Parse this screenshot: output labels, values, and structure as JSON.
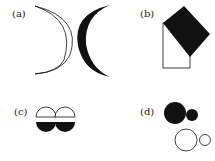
{
  "figure": {
    "panels": [
      {
        "id": "a",
        "label": "(a)",
        "content": "two thin arc outlines (crescent outline) and a filled black crescent"
      },
      {
        "id": "b",
        "label": "(b)",
        "content": "rotated black square overlapping a white rectangle outline"
      },
      {
        "id": "c",
        "label": "(c)",
        "content": "two white semicircle domes above two black semicircle bowls"
      },
      {
        "id": "d",
        "label": "(d)",
        "content": "large and small black circles above large and small white outline circles"
      }
    ],
    "colors": {
      "ink": "#111111",
      "paper": "#ffffff"
    }
  }
}
